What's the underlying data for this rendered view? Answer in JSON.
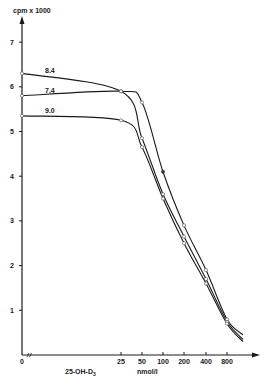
{
  "chart_data": {
    "type": "line",
    "title": "",
    "ylabel": "cpm x 1000",
    "xlabel": "25-OH-D3",
    "xunit": "nmol/l",
    "x_scale": "log2 (broken axis at 0)",
    "x_ticks": [
      "0",
      "25",
      "50",
      "100",
      "200",
      "400",
      "800"
    ],
    "y_ticks": [
      "1",
      "2",
      "3",
      "4",
      "5",
      "6",
      "7"
    ],
    "ylim": [
      0,
      7.5
    ],
    "grid": false,
    "legend_position": "inline labels near curves at left",
    "x": [
      0,
      25,
      50,
      100,
      200,
      400,
      800
    ],
    "series": [
      {
        "name": "8.4",
        "values": [
          6.3,
          5.9,
          4.85,
          3.6,
          2.65,
          1.7,
          0.75
        ]
      },
      {
        "name": "7.4",
        "values": [
          5.8,
          5.9,
          5.65,
          4.1,
          2.9,
          1.9,
          0.8
        ]
      },
      {
        "name": "9.0",
        "values": [
          5.35,
          5.25,
          4.65,
          3.5,
          2.5,
          1.6,
          0.7
        ]
      }
    ]
  },
  "labels": {
    "y_axis_title": "cpm x 1000",
    "x_axis_title_left": "25-OH-D",
    "x_axis_title_sub": "3",
    "x_axis_unit": "nmol/l"
  }
}
